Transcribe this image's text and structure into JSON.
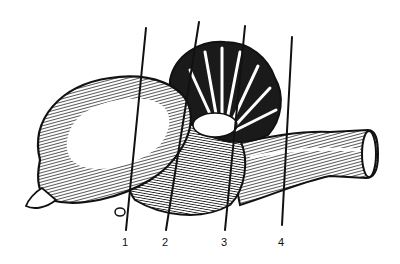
{
  "figure": {
    "background": "#ffffff",
    "ink": "#111111"
  },
  "labels": [
    {
      "text": "1",
      "x": 122,
      "y": 237,
      "line": [
        146,
        28,
        126,
        230
      ]
    },
    {
      "text": "2",
      "x": 162,
      "y": 237,
      "line": [
        199,
        22,
        166,
        230
      ]
    },
    {
      "text": "3",
      "x": 221,
      "y": 237,
      "line": [
        245,
        26,
        225,
        230
      ]
    },
    {
      "text": "4",
      "x": 278,
      "y": 237,
      "line": [
        292,
        37,
        282,
        225
      ]
    }
  ]
}
